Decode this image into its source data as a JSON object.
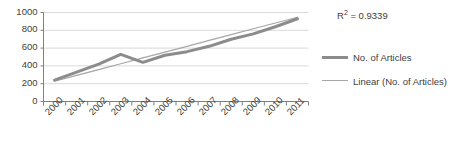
{
  "chart_data": {
    "type": "line",
    "title": "",
    "xlabel": "",
    "ylabel": "",
    "categories": [
      "2000",
      "2001",
      "2002",
      "2003",
      "2004",
      "2005",
      "2006",
      "2007",
      "2008",
      "2009",
      "2010",
      "2011"
    ],
    "series": [
      {
        "name": "No. of Articles",
        "values": [
          240,
          330,
          420,
          530,
          440,
          520,
          560,
          620,
          700,
          760,
          840,
          930
        ],
        "color": "#8c8c8c",
        "width": 3
      },
      {
        "name": "Linear (No. of Articles)",
        "values": [
          228,
          293,
          359,
          424,
          490,
          555,
          620,
          686,
          751,
          817,
          882,
          947
        ],
        "color": "#a6a6a6",
        "width": 1.2
      }
    ],
    "ylim": [
      0,
      1000
    ],
    "yticks": [
      0,
      200,
      400,
      600,
      800,
      1000
    ],
    "ytick_labels": [
      "0",
      "200",
      "400",
      "600",
      "800",
      "1000"
    ],
    "grid": true,
    "legend_position": "right",
    "annotations": [
      {
        "name": "r2",
        "prefix": "R",
        "superscript": "2",
        "text": " = 0.9339"
      }
    ]
  },
  "legend": {
    "entries": [
      {
        "label": "No. of Articles"
      },
      {
        "label": "Linear (No. of Articles)"
      }
    ]
  },
  "colors": {
    "grid": "#d9d9d9",
    "axis": "#808080",
    "text": "#404040",
    "series_main": "#8c8c8c",
    "series_trend": "#a6a6a6"
  }
}
